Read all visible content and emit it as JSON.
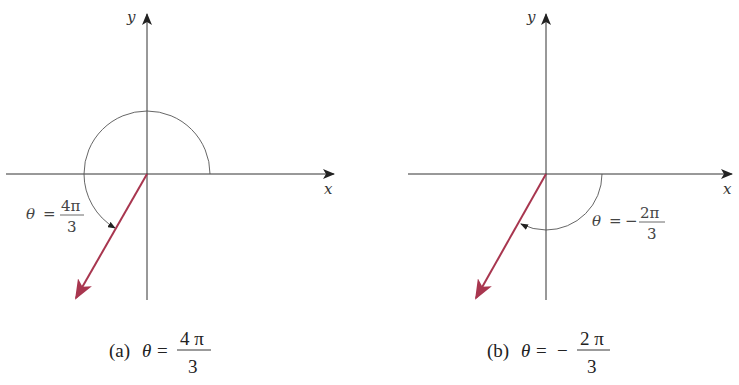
{
  "figures": [
    {
      "id": "a",
      "caption_prefix": "(a)",
      "caption_theta": "θ",
      "caption_eq": "=",
      "caption_sign": "",
      "caption_num": "4 π",
      "caption_den": "3",
      "label_theta": "θ",
      "label_eq": "=",
      "label_sign": "",
      "label_num": "4π",
      "label_den": "3",
      "x_axis_label": "x",
      "y_axis_label": "y",
      "angle_radians": "4π/3",
      "direction": "counterclockwise"
    },
    {
      "id": "b",
      "caption_prefix": "(b)",
      "caption_theta": "θ",
      "caption_eq": "=",
      "caption_sign": "−",
      "caption_num": "2 π",
      "caption_den": "3",
      "label_theta": "θ",
      "label_eq": "=",
      "label_sign": "−",
      "label_num": "2π",
      "label_den": "3",
      "x_axis_label": "x",
      "y_axis_label": "y",
      "angle_radians": "-2π/3",
      "direction": "clockwise"
    }
  ],
  "colors": {
    "axis": "#333333",
    "arc": "#555555",
    "vector": "#a8364f"
  }
}
